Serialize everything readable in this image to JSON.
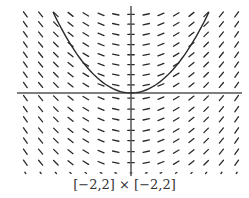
{
  "figure": {
    "type": "slope-field",
    "caption": "[−2,2] × [−2,2]",
    "window": {
      "xmin": -2,
      "xmax": 2,
      "ymin": -2,
      "ymax": 2
    },
    "differential_equation": "dy/dx = x",
    "solution_curve": "y = x^2/2 + C (parabola through origin)",
    "colors": {
      "ink": "#2a2a2a",
      "axis": "#555555",
      "background": "#ffffff"
    }
  },
  "chart_data": {
    "type": "slope-field",
    "title": "",
    "xlabel": "",
    "ylabel": "",
    "xlim": [
      -2,
      2
    ],
    "ylim": [
      -2,
      2
    ],
    "grid": false,
    "caption": "[−2,2] × [−2,2]",
    "field_columns_x": [
      -1.87,
      -1.6,
      -1.33,
      -1.07,
      -0.8,
      -0.53,
      -0.27,
      0.0,
      0.27,
      0.53,
      0.8,
      1.07,
      1.33,
      1.6,
      1.87
    ],
    "field_rows_y": [
      1.85,
      1.62,
      1.38,
      1.14,
      0.9,
      0.67,
      0.43,
      0.19,
      -0.12,
      -0.38,
      -0.62,
      -0.88,
      -1.12,
      -1.38,
      -1.64,
      -1.88
    ],
    "slope_rule": "slope = x",
    "curve": {
      "x": [
        -1.4,
        -1.0,
        -0.5,
        0,
        0.5,
        1.0,
        1.4
      ],
      "y": [
        1.96,
        1.0,
        0.25,
        0,
        0.25,
        1.0,
        1.96
      ]
    }
  }
}
